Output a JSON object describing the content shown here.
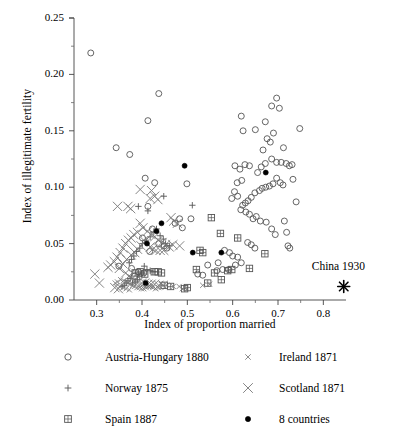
{
  "chart_data": {
    "type": "scatter",
    "title": "",
    "xlabel": "Index of proportion married",
    "ylabel": "Index of illegitimate fertility",
    "xlim": [
      0.25,
      0.85
    ],
    "ylim": [
      0.0,
      0.25
    ],
    "xticks": [
      0.3,
      0.4,
      0.5,
      0.6,
      0.7,
      0.8
    ],
    "xtick_labels": [
      "0.3",
      "0.4",
      "0.5",
      "0.6",
      "0.7",
      "0.8"
    ],
    "yticks": [
      0.0,
      0.05,
      0.1,
      0.15,
      0.2,
      0.25
    ],
    "ytick_labels": [
      "0.00",
      "0.05",
      "0.10",
      "0.15",
      "0.20",
      "0.25"
    ],
    "minor_ticks": true,
    "grid": false,
    "legend_position": "below",
    "annotations": [
      {
        "text": "China 1930",
        "x": 0.845,
        "y": 0.0285,
        "marker": "asterisk",
        "marker_x": 0.845,
        "marker_y": 0.012
      }
    ],
    "series": [
      {
        "name": "Austria-Hungary 1880",
        "marker": "open-circle",
        "color": "#555555",
        "points": [
          [
            0.287,
            0.219
          ],
          [
            0.343,
            0.135
          ],
          [
            0.373,
            0.129
          ],
          [
            0.413,
            0.159
          ],
          [
            0.437,
            0.183
          ],
          [
            0.407,
            0.108
          ],
          [
            0.428,
            0.104
          ],
          [
            0.413,
            0.083
          ],
          [
            0.483,
            0.072
          ],
          [
            0.489,
            0.064
          ],
          [
            0.499,
            0.103
          ],
          [
            0.508,
            0.072
          ],
          [
            0.473,
            0.068
          ],
          [
            0.423,
            0.063
          ],
          [
            0.401,
            0.055
          ],
          [
            0.437,
            0.05
          ],
          [
            0.449,
            0.048
          ],
          [
            0.455,
            0.046
          ],
          [
            0.417,
            0.043
          ],
          [
            0.349,
            0.03
          ],
          [
            0.377,
            0.028
          ],
          [
            0.392,
            0.025
          ],
          [
            0.404,
            0.024
          ],
          [
            0.383,
            0.021
          ],
          [
            0.545,
            0.031
          ],
          [
            0.568,
            0.033
          ],
          [
            0.523,
            0.023
          ],
          [
            0.534,
            0.022
          ],
          [
            0.582,
            0.044
          ],
          [
            0.593,
            0.042
          ],
          [
            0.6,
            0.039
          ],
          [
            0.611,
            0.038
          ],
          [
            0.619,
            0.163
          ],
          [
            0.623,
            0.15
          ],
          [
            0.65,
            0.151
          ],
          [
            0.672,
            0.158
          ],
          [
            0.686,
            0.172
          ],
          [
            0.697,
            0.179
          ],
          [
            0.703,
            0.17
          ],
          [
            0.69,
            0.148
          ],
          [
            0.683,
            0.14
          ],
          [
            0.676,
            0.143
          ],
          [
            0.667,
            0.133
          ],
          [
            0.712,
            0.135
          ],
          [
            0.748,
            0.152
          ],
          [
            0.733,
            0.107
          ],
          [
            0.707,
            0.122
          ],
          [
            0.697,
            0.122
          ],
          [
            0.686,
            0.125
          ],
          [
            0.672,
            0.121
          ],
          [
            0.663,
            0.118
          ],
          [
            0.655,
            0.113
          ],
          [
            0.697,
            0.108
          ],
          [
            0.705,
            0.104
          ],
          [
            0.711,
            0.102
          ],
          [
            0.689,
            0.103
          ],
          [
            0.681,
            0.101
          ],
          [
            0.673,
            0.1
          ],
          [
            0.665,
            0.099
          ],
          [
            0.659,
            0.097
          ],
          [
            0.649,
            0.095
          ],
          [
            0.641,
            0.091
          ],
          [
            0.634,
            0.088
          ],
          [
            0.628,
            0.086
          ],
          [
            0.622,
            0.084
          ],
          [
            0.618,
            0.08
          ],
          [
            0.629,
            0.078
          ],
          [
            0.637,
            0.076
          ],
          [
            0.645,
            0.072
          ],
          [
            0.652,
            0.074
          ],
          [
            0.661,
            0.07
          ],
          [
            0.62,
            0.106
          ],
          [
            0.61,
            0.104
          ],
          [
            0.604,
            0.096
          ],
          [
            0.598,
            0.09
          ],
          [
            0.611,
            0.092
          ],
          [
            0.616,
            0.116
          ],
          [
            0.627,
            0.12
          ],
          [
            0.637,
            0.119
          ],
          [
            0.605,
            0.119
          ],
          [
            0.718,
            0.121
          ],
          [
            0.725,
            0.119
          ],
          [
            0.731,
            0.12
          ],
          [
            0.74,
            0.087
          ],
          [
            0.714,
            0.07
          ],
          [
            0.719,
            0.06
          ],
          [
            0.722,
            0.048
          ],
          [
            0.726,
            0.046
          ],
          [
            0.694,
            0.058
          ],
          [
            0.686,
            0.063
          ],
          [
            0.674,
            0.069
          ],
          [
            0.649,
            0.046
          ],
          [
            0.641,
            0.049
          ],
          [
            0.633,
            0.051
          ],
          [
            0.619,
            0.033
          ],
          [
            0.606,
            0.031
          ],
          [
            0.591,
            0.027
          ],
          [
            0.578,
            0.027
          ],
          [
            0.565,
            0.026
          ]
        ]
      },
      {
        "name": "Norway 1875",
        "marker": "plus",
        "color": "#555555",
        "points": [
          [
            0.413,
            0.079
          ],
          [
            0.392,
            0.083
          ],
          [
            0.511,
            0.084
          ],
          [
            0.448,
            0.092
          ],
          [
            0.432,
            0.063
          ],
          [
            0.426,
            0.06
          ],
          [
            0.418,
            0.056
          ],
          [
            0.409,
            0.053
          ],
          [
            0.401,
            0.05
          ],
          [
            0.395,
            0.046
          ],
          [
            0.388,
            0.043
          ],
          [
            0.382,
            0.039
          ],
          [
            0.377,
            0.036
          ],
          [
            0.372,
            0.033
          ],
          [
            0.44,
            0.057
          ],
          [
            0.447,
            0.054
          ],
          [
            0.452,
            0.05
          ],
          [
            0.461,
            0.048
          ],
          [
            0.405,
            0.03
          ],
          [
            0.411,
            0.027
          ],
          [
            0.418,
            0.026
          ],
          [
            0.424,
            0.025
          ],
          [
            0.4,
            0.024
          ],
          [
            0.395,
            0.021
          ],
          [
            0.39,
            0.018
          ],
          [
            0.385,
            0.016
          ],
          [
            0.379,
            0.015
          ],
          [
            0.374,
            0.019
          ],
          [
            0.369,
            0.017
          ],
          [
            0.365,
            0.015
          ],
          [
            0.361,
            0.013
          ],
          [
            0.356,
            0.012
          ]
        ]
      },
      {
        "name": "Spain 1887",
        "marker": "square-plus",
        "color": "#555555",
        "points": [
          [
            0.553,
            0.073
          ],
          [
            0.573,
            0.059
          ],
          [
            0.611,
            0.055
          ],
          [
            0.671,
            0.041
          ],
          [
            0.52,
            0.027
          ],
          [
            0.598,
            0.027
          ],
          [
            0.637,
            0.028
          ],
          [
            0.56,
            0.024
          ],
          [
            0.545,
            0.015
          ],
          [
            0.575,
            0.018
          ],
          [
            0.589,
            0.026
          ],
          [
            0.528,
            0.044
          ],
          [
            0.534,
            0.042
          ],
          [
            0.427,
            0.025
          ],
          [
            0.436,
            0.025
          ],
          [
            0.443,
            0.024
          ],
          [
            0.396,
            0.025
          ],
          [
            0.385,
            0.024
          ],
          [
            0.406,
            0.023
          ],
          [
            0.449,
            0.013
          ],
          [
            0.463,
            0.012
          ],
          [
            0.5,
            0.011
          ],
          [
            0.494,
            0.01
          ]
        ]
      },
      {
        "name": "Ireland 1871",
        "marker": "small-x",
        "color": "#777777",
        "points": [
          [
            0.353,
            0.018
          ],
          [
            0.359,
            0.017
          ],
          [
            0.364,
            0.016
          ],
          [
            0.369,
            0.015
          ],
          [
            0.374,
            0.014
          ],
          [
            0.379,
            0.013
          ],
          [
            0.384,
            0.012
          ],
          [
            0.389,
            0.011
          ],
          [
            0.394,
            0.011
          ],
          [
            0.399,
            0.01
          ],
          [
            0.404,
            0.01
          ],
          [
            0.409,
            0.011
          ],
          [
            0.414,
            0.012
          ],
          [
            0.419,
            0.012
          ],
          [
            0.424,
            0.011
          ],
          [
            0.43,
            0.01
          ],
          [
            0.437,
            0.011
          ],
          [
            0.346,
            0.016
          ],
          [
            0.341,
            0.015
          ],
          [
            0.351,
            0.012
          ],
          [
            0.358,
            0.011
          ],
          [
            0.365,
            0.01
          ],
          [
            0.372,
            0.009
          ],
          [
            0.489,
            0.01
          ],
          [
            0.494,
            0.011
          ],
          [
            0.534,
            0.013
          ],
          [
            0.549,
            0.014
          ],
          [
            0.482,
            0.012
          ],
          [
            0.442,
            0.014
          ],
          [
            0.455,
            0.013
          ],
          [
            0.469,
            0.012
          ]
        ]
      },
      {
        "name": "Scotland 1871",
        "marker": "large-x",
        "color": "#777777",
        "points": [
          [
            0.346,
            0.083
          ],
          [
            0.369,
            0.083
          ],
          [
            0.375,
            0.081
          ],
          [
            0.396,
            0.098
          ],
          [
            0.418,
            0.09
          ],
          [
            0.428,
            0.092
          ],
          [
            0.421,
            0.097
          ],
          [
            0.435,
            0.089
          ],
          [
            0.464,
            0.073
          ],
          [
            0.47,
            0.07
          ],
          [
            0.478,
            0.068
          ],
          [
            0.396,
            0.068
          ],
          [
            0.402,
            0.064
          ],
          [
            0.39,
            0.06
          ],
          [
            0.382,
            0.058
          ],
          [
            0.376,
            0.055
          ],
          [
            0.37,
            0.053
          ],
          [
            0.364,
            0.05
          ],
          [
            0.358,
            0.046
          ],
          [
            0.352,
            0.042
          ],
          [
            0.345,
            0.038
          ],
          [
            0.339,
            0.034
          ],
          [
            0.331,
            0.031
          ],
          [
            0.325,
            0.029
          ],
          [
            0.412,
            0.061
          ],
          [
            0.42,
            0.058
          ],
          [
            0.428,
            0.056
          ],
          [
            0.436,
            0.053
          ],
          [
            0.444,
            0.051
          ],
          [
            0.452,
            0.049
          ],
          [
            0.46,
            0.047
          ],
          [
            0.468,
            0.049
          ],
          [
            0.406,
            0.052
          ],
          [
            0.398,
            0.048
          ],
          [
            0.39,
            0.045
          ],
          [
            0.384,
            0.042
          ],
          [
            0.376,
            0.04
          ],
          [
            0.366,
            0.036
          ],
          [
            0.358,
            0.032
          ],
          [
            0.35,
            0.028
          ],
          [
            0.296,
            0.023
          ],
          [
            0.306,
            0.015
          ],
          [
            0.418,
            0.047
          ],
          [
            0.424,
            0.045
          ],
          [
            0.431,
            0.044
          ],
          [
            0.44,
            0.044
          ],
          [
            0.448,
            0.044
          ],
          [
            0.483,
            0.048
          ],
          [
            0.364,
            0.024
          ],
          [
            0.371,
            0.021
          ],
          [
            0.378,
            0.019
          ],
          [
            0.385,
            0.017
          ],
          [
            0.392,
            0.016
          ],
          [
            0.399,
            0.015
          ],
          [
            0.406,
            0.015
          ],
          [
            0.413,
            0.014
          ],
          [
            0.42,
            0.014
          ],
          [
            0.428,
            0.014
          ],
          [
            0.437,
            0.013
          ],
          [
            0.447,
            0.013
          ],
          [
            0.34,
            0.011
          ],
          [
            0.348,
            0.01
          ]
        ]
      },
      {
        "name": "8 countries",
        "marker": "filled-dot",
        "color": "#000000",
        "points": [
          [
            0.494,
            0.119
          ],
          [
            0.673,
            0.113
          ],
          [
            0.443,
            0.068
          ],
          [
            0.432,
            0.061
          ],
          [
            0.411,
            0.05
          ],
          [
            0.512,
            0.042
          ],
          [
            0.575,
            0.042
          ],
          [
            0.408,
            0.015
          ]
        ]
      }
    ]
  },
  "legend": {
    "entries": [
      {
        "label": "Austria-Hungary 1880",
        "marker": "open-circle"
      },
      {
        "label": "Norway 1875",
        "marker": "plus"
      },
      {
        "label": "Spain 1887",
        "marker": "square-plus"
      },
      {
        "label": "Ireland 1871",
        "marker": "small-x"
      },
      {
        "label": "Scotland 1871",
        "marker": "large-x"
      },
      {
        "label": "8 countries",
        "marker": "filled-dot"
      }
    ]
  }
}
